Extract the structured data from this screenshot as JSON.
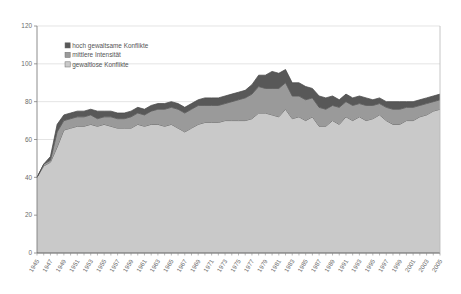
{
  "chart_data": {
    "type": "area",
    "stacked": true,
    "title": "",
    "subtitle": "",
    "xlabel": "",
    "ylabel": "",
    "xlim": [
      1945,
      2005
    ],
    "ylim": [
      0,
      120
    ],
    "yticks": [
      0,
      20,
      40,
      60,
      80,
      100,
      120
    ],
    "ytick_labels": [
      "0",
      "20",
      "40",
      "60",
      "80",
      "100",
      "120"
    ],
    "grid": true,
    "legend_position": "inside-top-left",
    "categories": [
      1945,
      1946,
      1947,
      1948,
      1949,
      1950,
      1951,
      1952,
      1953,
      1954,
      1955,
      1956,
      1957,
      1958,
      1959,
      1960,
      1961,
      1962,
      1963,
      1964,
      1965,
      1966,
      1967,
      1968,
      1969,
      1970,
      1971,
      1972,
      1973,
      1974,
      1975,
      1976,
      1977,
      1978,
      1979,
      1980,
      1981,
      1982,
      1983,
      1984,
      1985,
      1986,
      1987,
      1988,
      1989,
      1990,
      1991,
      1992,
      1993,
      1994,
      1995,
      1996,
      1997,
      1998,
      1999,
      2000,
      2001,
      2002,
      2003,
      2004,
      2005
    ],
    "tick_categories": [
      1945,
      1947,
      1949,
      1951,
      1953,
      1955,
      1957,
      1959,
      1961,
      1963,
      1965,
      1967,
      1969,
      1971,
      1973,
      1975,
      1977,
      1979,
      1981,
      1983,
      1985,
      1987,
      1989,
      1991,
      1993,
      1995,
      1997,
      1999,
      2001,
      2003,
      2005
    ],
    "series": [
      {
        "name": "gewaltlose Konflikte",
        "color": "#c9c9c9",
        "values": [
          40,
          46,
          48,
          56,
          65,
          66,
          67,
          67,
          68,
          67,
          68,
          67,
          66,
          66,
          66,
          68,
          67,
          68,
          68,
          67,
          68,
          66,
          64,
          66,
          68,
          69,
          69,
          69,
          70,
          70,
          70,
          70,
          71,
          74,
          74,
          73,
          72,
          76,
          71,
          72,
          70,
          72,
          67,
          67,
          70,
          68,
          72,
          70,
          72,
          70,
          71,
          73,
          70,
          68,
          68,
          70,
          70,
          72,
          73,
          75,
          76
        ]
      },
      {
        "name": "mittlere Intensität",
        "color": "#9a9a9a",
        "values": [
          0,
          1,
          1,
          8,
          5,
          5,
          5,
          5,
          5,
          4,
          4,
          5,
          5,
          5,
          6,
          6,
          6,
          7,
          8,
          9,
          9,
          10,
          10,
          10,
          10,
          9,
          9,
          9,
          9,
          10,
          11,
          12,
          13,
          14,
          13,
          14,
          15,
          14,
          12,
          11,
          11,
          10,
          10,
          9,
          8,
          9,
          8,
          8,
          7,
          8,
          7,
          6,
          7,
          8,
          8,
          7,
          7,
          6,
          6,
          5,
          5
        ]
      },
      {
        "name": "hoch gewaltsame Konflikte",
        "color": "#585858",
        "values": [
          0,
          0,
          2,
          4,
          3,
          3,
          3,
          3,
          3,
          4,
          3,
          3,
          3,
          3,
          3,
          3,
          3,
          3,
          3,
          3,
          3,
          3,
          3,
          3,
          3,
          4,
          4,
          4,
          4,
          4,
          4,
          4,
          5,
          6,
          7,
          9,
          8,
          7,
          7,
          7,
          7,
          5,
          6,
          6,
          5,
          4,
          4,
          4,
          4,
          4,
          3,
          3,
          3,
          4,
          4,
          3,
          3,
          3,
          3,
          3,
          3
        ]
      }
    ],
    "legend_entries": [
      {
        "label": "hoch gewaltsame Konflikte",
        "color": "#585858"
      },
      {
        "label": "mittlere Intensität",
        "color": "#9a9a9a"
      },
      {
        "label": "gewaltlose Konflikte",
        "color": "#c9c9c9"
      }
    ],
    "colors": {
      "high_violence": "#585858",
      "medium_intensity": "#9a9a9a",
      "nonviolent": "#c9c9c9",
      "grid": "#d8d8d8",
      "axis": "#808080",
      "text": "#6b6b6b",
      "background": "#ffffff"
    }
  }
}
